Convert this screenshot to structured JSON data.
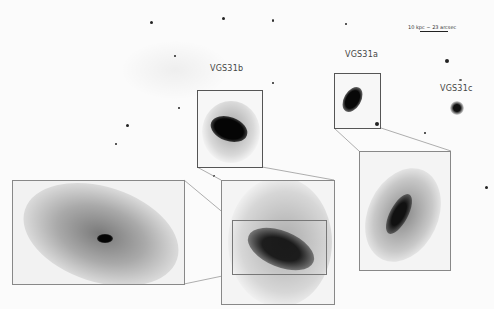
{
  "figure": {
    "scale_bar": {
      "text": "10 kpc ~ 23 arcsec"
    },
    "labels": {
      "vgs31a": "VGS31a",
      "vgs31b": "VGS31b",
      "vgs31c": "VGS31c"
    },
    "colors": {
      "background": "#fbfbfb",
      "frame": "#555555",
      "connector": "#888888",
      "galaxy_core": "#0a0a0a"
    }
  }
}
